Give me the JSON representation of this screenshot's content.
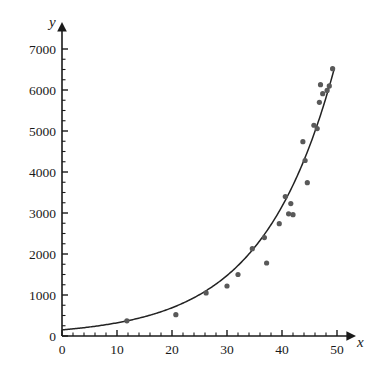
{
  "chart_data": {
    "type": "scatter",
    "title": "",
    "subtitle": "",
    "xlabel": "x",
    "ylabel": "y",
    "xlim": [
      0,
      50
    ],
    "ylim": [
      0,
      7000
    ],
    "grid": false,
    "legend": false,
    "legend_position": "none",
    "x_ticks": [
      0,
      10,
      20,
      30,
      40,
      50
    ],
    "x_tick_labels": [
      "0",
      "10",
      "20",
      "30",
      "40",
      "50"
    ],
    "x_minor_tick_step": 2,
    "y_ticks": [
      0,
      1000,
      2000,
      3000,
      4000,
      5000,
      6000,
      7000
    ],
    "y_tick_labels": [
      "0",
      "1000",
      "2000",
      "3000",
      "4000",
      "5000",
      "6000",
      "7000"
    ],
    "y_minor_tick_step": 250,
    "point_color": "#595959",
    "curve_color": "#232323",
    "axis_color": "#1a1a1a",
    "series": [
      {
        "name": "observed data",
        "type": "scatter",
        "x": [
          11.8,
          20.7,
          26.2,
          30.0,
          32.0,
          34.6,
          36.8,
          37.2,
          39.5,
          40.6,
          41.2,
          41.6,
          42.0,
          43.8,
          44.2,
          44.6,
          45.8,
          46.4,
          46.8,
          47.0,
          47.4,
          48.2,
          48.6,
          49.2
        ],
        "y": [
          370,
          520,
          1050,
          1220,
          1500,
          2130,
          2400,
          1780,
          2740,
          3400,
          2980,
          3230,
          2960,
          4740,
          4280,
          3740,
          5140,
          5060,
          5700,
          6130,
          5910,
          5990,
          6100,
          6520
        ]
      },
      {
        "name": "exponential fit",
        "type": "line",
        "equation_form": "y = a * exp(b * x)",
        "a": 150,
        "b": 0.0762,
        "x_range": [
          0,
          49.5
        ]
      }
    ]
  }
}
